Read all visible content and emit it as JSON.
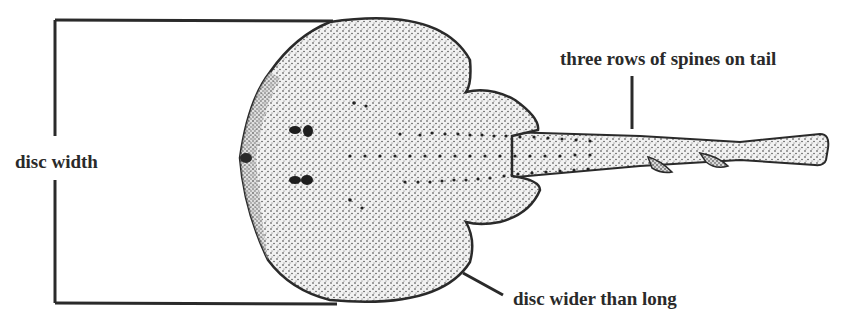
{
  "figure": {
    "colors": {
      "ink": "#2a2a2a",
      "background": "#ffffff",
      "body_fill": "#e9e9e9"
    }
  },
  "labels": {
    "disc_width": "disc width",
    "tail_spines": "three rows of spines on tail",
    "disc_shape": "disc wider than long"
  },
  "annotations": [
    {
      "id": "disc-width-bracket",
      "label_key": "disc_width",
      "type": "bracket"
    },
    {
      "id": "tail-spines-leader",
      "label_key": "tail_spines",
      "type": "leader-line"
    },
    {
      "id": "disc-shape-leader",
      "label_key": "disc_shape",
      "type": "leader-line"
    }
  ]
}
